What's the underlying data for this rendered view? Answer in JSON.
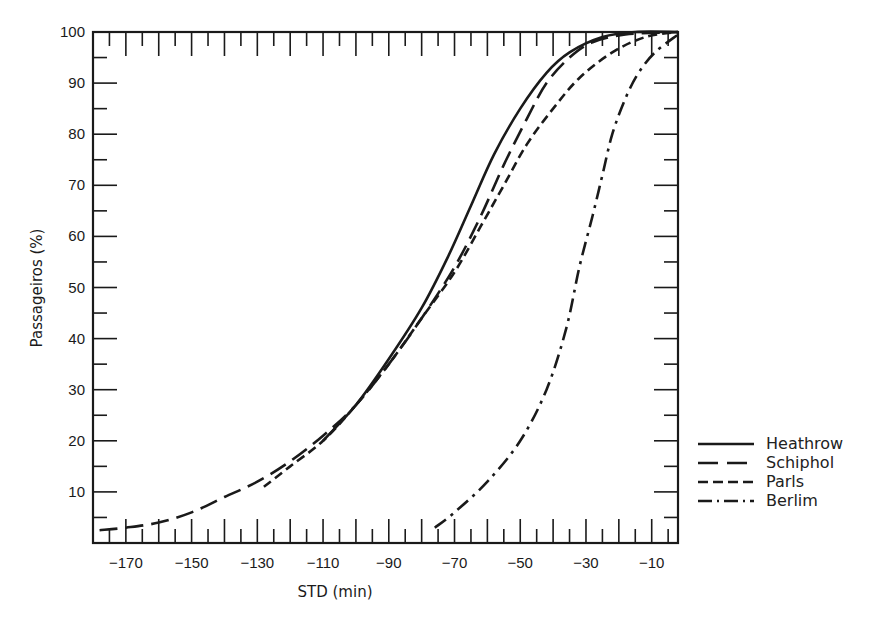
{
  "chart_data": {
    "type": "line",
    "title": "",
    "xlabel": "STD (min)",
    "ylabel": "Passageiros (%)",
    "xlim": [
      -180,
      -2
    ],
    "ylim": [
      0,
      100
    ],
    "grid": false,
    "legend_position": "right-bottom-outside",
    "x_ticks": [
      -170,
      -150,
      -130,
      -110,
      -90,
      -70,
      -50,
      -30,
      -10
    ],
    "y_ticks": [
      10,
      20,
      30,
      40,
      50,
      60,
      70,
      80,
      90,
      100
    ],
    "series": [
      {
        "name": "Heathrow",
        "style": "solid",
        "points": [
          [
            -110,
            20
          ],
          [
            -100,
            27
          ],
          [
            -90,
            36
          ],
          [
            -80,
            46
          ],
          [
            -72,
            56
          ],
          [
            -65,
            66
          ],
          [
            -58,
            76
          ],
          [
            -50,
            85
          ],
          [
            -42,
            92
          ],
          [
            -35,
            96
          ],
          [
            -25,
            99
          ],
          [
            -15,
            100
          ],
          [
            -2,
            100
          ]
        ]
      },
      {
        "name": "Schiphol",
        "style": "long-dash",
        "points": [
          [
            -178,
            2.5
          ],
          [
            -170,
            3
          ],
          [
            -160,
            4
          ],
          [
            -150,
            6
          ],
          [
            -140,
            9
          ],
          [
            -130,
            12
          ],
          [
            -120,
            16
          ],
          [
            -110,
            21
          ],
          [
            -100,
            27
          ],
          [
            -90,
            35
          ],
          [
            -80,
            44
          ],
          [
            -70,
            54
          ],
          [
            -62,
            64
          ],
          [
            -55,
            74
          ],
          [
            -48,
            83
          ],
          [
            -42,
            90
          ],
          [
            -35,
            95
          ],
          [
            -28,
            98
          ],
          [
            -18,
            99.5
          ],
          [
            -2,
            100
          ]
        ]
      },
      {
        "name": "Paris",
        "style": "short-dash",
        "points": [
          [
            -128,
            11
          ],
          [
            -120,
            15
          ],
          [
            -110,
            20
          ],
          [
            -100,
            27
          ],
          [
            -90,
            35
          ],
          [
            -80,
            44
          ],
          [
            -70,
            53
          ],
          [
            -62,
            62
          ],
          [
            -55,
            70
          ],
          [
            -48,
            78
          ],
          [
            -40,
            85
          ],
          [
            -32,
            91
          ],
          [
            -22,
            96
          ],
          [
            -12,
            99
          ],
          [
            -2,
            100
          ]
        ]
      },
      {
        "name": "Berlim",
        "style": "dash-dot",
        "points": [
          [
            -76,
            3
          ],
          [
            -70,
            6
          ],
          [
            -60,
            12
          ],
          [
            -50,
            20
          ],
          [
            -42,
            30
          ],
          [
            -36,
            42
          ],
          [
            -32,
            54
          ],
          [
            -28,
            64
          ],
          [
            -25,
            72
          ],
          [
            -22,
            80
          ],
          [
            -18,
            87
          ],
          [
            -14,
            92
          ],
          [
            -9,
            96
          ],
          [
            -2,
            99.5
          ]
        ]
      }
    ]
  },
  "legend": {
    "items": [
      {
        "label": "Heathrow"
      },
      {
        "label": "Schiphol"
      },
      {
        "label": "Parls"
      },
      {
        "label": "Berlim"
      }
    ]
  },
  "axes": {
    "x_title": "STD (min)",
    "y_title": "Passageiros (%)",
    "x_tick_labels": [
      "−170",
      "−150",
      "−130",
      "−110",
      "−90",
      "−70",
      "−50",
      "−30",
      "−10"
    ],
    "y_tick_labels": [
      "10",
      "20",
      "30",
      "40",
      "50",
      "60",
      "70",
      "80",
      "90",
      "100"
    ]
  },
  "colors": {
    "ink": "#1a1a1a",
    "background": "#ffffff"
  }
}
